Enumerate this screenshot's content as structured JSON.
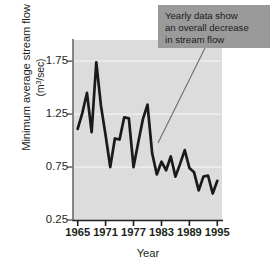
{
  "figure": {
    "annotation": {
      "name": "callout-box",
      "lines": [
        "Yearly data show",
        "an overall decrease",
        "in stream flow"
      ],
      "background_color": "#9a9a9a",
      "leader_line_from": [
        205,
        48
      ],
      "leader_line_to": [
        158,
        143
      ]
    }
  },
  "chart_data": {
    "type": "line",
    "title": "",
    "xlabel": "Year",
    "ylabel": "Minimum average stream flow (m3/sec)",
    "ylabel_main": "Minimum average stream flow",
    "ylabel_unit": "(m3/sec)",
    "xlim": [
      1964,
      1996
    ],
    "ylim": [
      0.25,
      1.95
    ],
    "xticks": [
      1965,
      1971,
      1977,
      1983,
      1989,
      1995
    ],
    "xtick_labels": [
      "1965",
      "1971",
      "1977",
      "1983",
      "1989",
      "1995"
    ],
    "yticks": [
      0.25,
      0.75,
      1.25,
      1.75
    ],
    "ytick_labels": [
      "0.25",
      "0.75",
      "1.25",
      "1.75"
    ],
    "gridlines": [
      0.75,
      1.25,
      1.75
    ],
    "grid": true,
    "legend": null,
    "plot_bg_color": "#dcdcdc",
    "line_color": "#1a1a1a",
    "x": [
      1965,
      1966,
      1967,
      1968,
      1969,
      1970,
      1971,
      1972,
      1973,
      1974,
      1975,
      1976,
      1977,
      1978,
      1979,
      1980,
      1981,
      1982,
      1983,
      1984,
      1985,
      1986,
      1987,
      1988,
      1989,
      1990,
      1991,
      1992,
      1993,
      1994,
      1995
    ],
    "values": [
      1.11,
      1.26,
      1.45,
      1.08,
      1.74,
      1.33,
      1.05,
      0.75,
      1.02,
      1.01,
      1.22,
      1.21,
      0.75,
      0.98,
      1.2,
      1.34,
      0.88,
      0.68,
      0.8,
      0.72,
      0.85,
      0.66,
      0.78,
      0.91,
      0.74,
      0.7,
      0.53,
      0.66,
      0.67,
      0.5,
      0.62
    ],
    "series": [
      {
        "name": "Minimum average stream flow",
        "values": [
          1.11,
          1.26,
          1.45,
          1.08,
          1.74,
          1.33,
          1.05,
          0.75,
          1.02,
          1.01,
          1.22,
          1.21,
          0.75,
          0.98,
          1.2,
          1.34,
          0.88,
          0.68,
          0.8,
          0.72,
          0.85,
          0.66,
          0.78,
          0.91,
          0.74,
          0.7,
          0.53,
          0.66,
          0.67,
          0.5,
          0.62
        ]
      }
    ]
  }
}
